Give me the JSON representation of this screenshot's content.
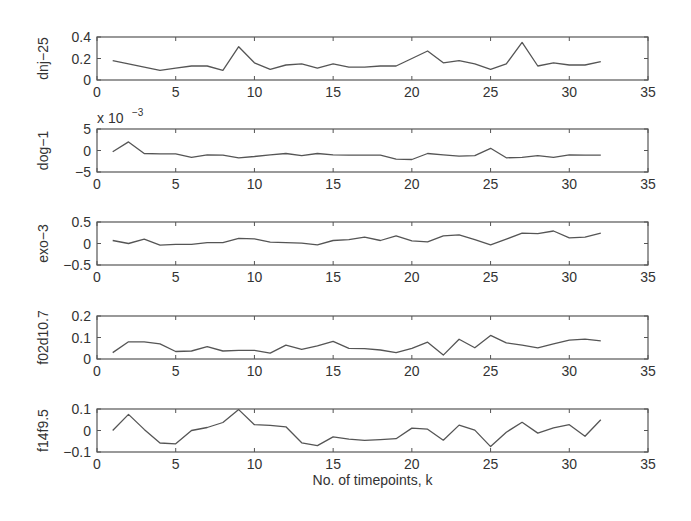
{
  "chart_data": [
    {
      "type": "line",
      "ylabel": "dnj−25",
      "xlabel": "",
      "exponent_label": "",
      "x": [
        1,
        2,
        3,
        4,
        5,
        6,
        7,
        8,
        9,
        10,
        11,
        12,
        13,
        14,
        15,
        16,
        17,
        18,
        19,
        20,
        21,
        22,
        23,
        24,
        25,
        26,
        27,
        28,
        29,
        30,
        31,
        32
      ],
      "values": [
        0.18,
        0.15,
        0.12,
        0.09,
        0.11,
        0.13,
        0.13,
        0.09,
        0.31,
        0.16,
        0.1,
        0.14,
        0.15,
        0.11,
        0.15,
        0.12,
        0.12,
        0.13,
        0.13,
        0.2,
        0.27,
        0.16,
        0.18,
        0.15,
        0.1,
        0.15,
        0.35,
        0.13,
        0.16,
        0.14,
        0.14,
        0.17
      ],
      "xlim": [
        0,
        35
      ],
      "ylim": [
        0,
        0.4
      ],
      "xticks": [
        "0",
        "5",
        "10",
        "15",
        "20",
        "25",
        "30",
        "35"
      ],
      "yticks": [
        "0",
        "0.2",
        "0.4"
      ],
      "ytick_values": [
        0,
        0.2,
        0.4
      ]
    },
    {
      "type": "line",
      "ylabel": "dog−1",
      "xlabel": "",
      "exponent_label": "x 10",
      "exponent_power": "−3",
      "x": [
        1,
        2,
        3,
        4,
        5,
        6,
        7,
        8,
        9,
        10,
        11,
        12,
        13,
        14,
        15,
        16,
        17,
        18,
        19,
        20,
        21,
        22,
        23,
        24,
        25,
        26,
        27,
        28,
        29,
        30,
        31,
        32
      ],
      "values": [
        -0.3,
        2.0,
        -0.7,
        -0.8,
        -0.8,
        -1.6,
        -1.0,
        -1.1,
        -1.7,
        -1.4,
        -1.0,
        -0.7,
        -1.2,
        -0.7,
        -1.0,
        -1.1,
        -1.1,
        -1.1,
        -2.0,
        -2.1,
        -0.7,
        -1.0,
        -1.3,
        -1.2,
        0.5,
        -1.7,
        -1.6,
        -1.2,
        -1.6,
        -1.0,
        -1.1,
        -1.1
      ],
      "xlim": [
        0,
        35
      ],
      "ylim": [
        -5,
        5
      ],
      "xticks": [
        "0",
        "5",
        "10",
        "15",
        "20",
        "25",
        "30",
        "35"
      ],
      "yticks": [
        "−5",
        "0",
        "5"
      ],
      "ytick_values": [
        -5,
        0,
        5
      ]
    },
    {
      "type": "line",
      "ylabel": "exo−3",
      "xlabel": "",
      "exponent_label": "",
      "x": [
        1,
        2,
        3,
        4,
        5,
        6,
        7,
        8,
        9,
        10,
        11,
        12,
        13,
        14,
        15,
        16,
        17,
        18,
        19,
        20,
        21,
        22,
        23,
        24,
        25,
        26,
        27,
        28,
        29,
        30,
        31,
        32
      ],
      "values": [
        0.07,
        0.0,
        0.1,
        -0.04,
        -0.02,
        -0.02,
        0.02,
        0.02,
        0.12,
        0.11,
        0.03,
        0.02,
        0.01,
        -0.03,
        0.07,
        0.09,
        0.15,
        0.07,
        0.18,
        0.06,
        0.04,
        0.18,
        0.2,
        0.09,
        -0.03,
        0.1,
        0.24,
        0.23,
        0.29,
        0.13,
        0.15,
        0.24
      ],
      "xlim": [
        0,
        35
      ],
      "ylim": [
        -0.5,
        0.5
      ],
      "xticks": [
        "0",
        "5",
        "10",
        "15",
        "20",
        "25",
        "30",
        "35"
      ],
      "yticks": [
        "−0.5",
        "0",
        "0.5"
      ],
      "ytick_values": [
        -0.5,
        0,
        0.5
      ]
    },
    {
      "type": "line",
      "ylabel": "f02d10.7",
      "xlabel": "",
      "exponent_label": "",
      "x": [
        1,
        2,
        3,
        4,
        5,
        6,
        7,
        8,
        9,
        10,
        11,
        12,
        13,
        14,
        15,
        16,
        17,
        18,
        19,
        20,
        21,
        22,
        23,
        24,
        25,
        26,
        27,
        28,
        29,
        30,
        31,
        32
      ],
      "values": [
        0.03,
        0.08,
        0.08,
        0.07,
        0.035,
        0.037,
        0.057,
        0.037,
        0.04,
        0.04,
        0.027,
        0.064,
        0.045,
        0.061,
        0.082,
        0.05,
        0.048,
        0.042,
        0.03,
        0.05,
        0.078,
        0.018,
        0.092,
        0.052,
        0.11,
        0.075,
        0.064,
        0.052,
        0.07,
        0.088,
        0.092,
        0.084
      ],
      "xlim": [
        0,
        35
      ],
      "ylim": [
        0,
        0.2
      ],
      "xticks": [
        "0",
        "5",
        "10",
        "15",
        "20",
        "25",
        "30",
        "35"
      ],
      "yticks": [
        "0",
        "0.1",
        "0.2"
      ],
      "ytick_values": [
        0,
        0.1,
        0.2
      ]
    },
    {
      "type": "line",
      "ylabel": "f14f9.5",
      "xlabel": "No. of timepoints, k",
      "exponent_label": "",
      "x": [
        1,
        2,
        3,
        4,
        5,
        6,
        7,
        8,
        9,
        10,
        11,
        12,
        13,
        14,
        15,
        16,
        17,
        18,
        19,
        20,
        21,
        22,
        23,
        24,
        25,
        26,
        27,
        28,
        29,
        30,
        31,
        32
      ],
      "values": [
        0.0,
        0.075,
        0.005,
        -0.058,
        -0.062,
        0.0,
        0.014,
        0.037,
        0.097,
        0.027,
        0.024,
        0.017,
        -0.057,
        -0.07,
        -0.03,
        -0.04,
        -0.046,
        -0.043,
        -0.038,
        0.011,
        0.006,
        -0.045,
        0.025,
        0.002,
        -0.075,
        -0.008,
        0.038,
        -0.012,
        0.012,
        0.027,
        -0.027,
        0.05
      ],
      "xlim": [
        0,
        35
      ],
      "ylim": [
        -0.1,
        0.1
      ],
      "xticks": [
        "0",
        "5",
        "10",
        "15",
        "20",
        "25",
        "30",
        "35"
      ],
      "yticks": [
        "−0.1",
        "0",
        "0.1"
      ],
      "ytick_values": [
        -0.1,
        0,
        0.1
      ]
    }
  ],
  "figure": {
    "xlabel": "No. of timepoints, k",
    "line_color": "#555555",
    "axis_color": "#555555",
    "text_color": "#333333",
    "background": "#ffffff"
  }
}
